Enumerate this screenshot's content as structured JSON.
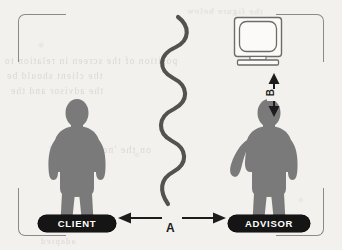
{
  "diagram": {
    "background_color": "#f3f1ee",
    "figure_color": "#7a7a7a",
    "ink_color": "#4a4a4a",
    "badge_color": "#151515",
    "badge_text_color": "#ffffff"
  },
  "figures": {
    "client": {
      "badge_label": "CLIENT",
      "icon_name": "person-silhouette"
    },
    "advisor": {
      "badge_label": "ADVISOR",
      "icon_name": "person-silhouette-arm-extended"
    }
  },
  "equipment": {
    "monitor": {
      "icon_name": "crt-monitor",
      "label": ""
    }
  },
  "connector": {
    "icon_name": "wavy-line",
    "description": ""
  },
  "measurements": [
    {
      "id": "a",
      "label": "A",
      "orientation": "horizontal",
      "icon_name": "double-headed-arrow-horizontal",
      "between": "CLIENT to ADVISOR"
    },
    {
      "id": "b",
      "label": "B",
      "orientation": "vertical",
      "icon_name": "double-headed-arrow-vertical",
      "between": "monitor to ADVISOR"
    }
  ],
  "frame": {
    "corners": [
      "top-left",
      "top-right",
      "bottom-left",
      "bottom-right"
    ]
  },
  "background_ghost_text": {
    "line_1": "the figure below",
    "line_2": "position of the screen in relation to",
    "line_3": "the client should be",
    "line_4": "the advisor and the",
    "line_5": "on the 'neutral zone'",
    "line_6": "adapted"
  }
}
